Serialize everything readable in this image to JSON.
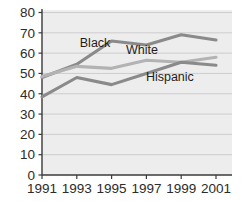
{
  "chart_data": {
    "type": "line",
    "title": "",
    "subtitle": "",
    "xlabel": "",
    "ylabel": "",
    "categories": [
      "1991",
      "1993",
      "1995",
      "1997",
      "1999",
      "2001"
    ],
    "x": [
      1991,
      1993,
      1995,
      1997,
      1999,
      2001
    ],
    "xlim": [
      1991,
      2001
    ],
    "ylim": [
      0,
      80
    ],
    "ytick_labels": [
      "0",
      "10",
      "20",
      "30",
      "40",
      "50",
      "60",
      "70",
      "80"
    ],
    "yticks": [
      0,
      10,
      20,
      30,
      40,
      50,
      60,
      70,
      80
    ],
    "xtick_labels": [
      "1991",
      "1993",
      "1995",
      "1997",
      "1999",
      "2001"
    ],
    "grid": "horizontal",
    "legend_position": "inline-annotations",
    "plot_background": "#ededed",
    "series": [
      {
        "name": "Black",
        "color": "#8a8a8a",
        "label_text": "Black",
        "label_x": 1994.05,
        "label_y": 63.0,
        "values": [
          48,
          54.5,
          66,
          64,
          69,
          66.5
        ]
      },
      {
        "name": "White",
        "color": "#b3b3b3",
        "label_text": "White",
        "label_x": 1996.75,
        "label_y": 59.5,
        "values": [
          48.5,
          53.5,
          52.5,
          56.5,
          55.5,
          58
        ]
      },
      {
        "name": "Hispanic",
        "color": "#8a8a8a",
        "label_text": "Hispanic",
        "label_x": 1998.35,
        "label_y": 46.5,
        "values": [
          38.5,
          48,
          44.5,
          50,
          55.5,
          54
        ]
      }
    ]
  },
  "axis": {
    "axis_color": "#3a3a3a",
    "grid_color": "#c9c9c9",
    "tick_color": "#3a3a3a"
  }
}
